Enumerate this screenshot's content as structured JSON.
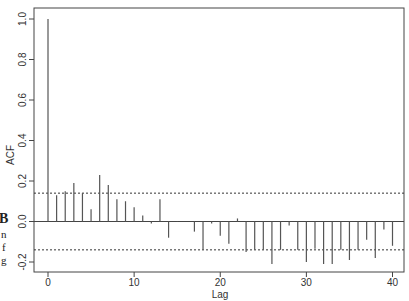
{
  "chart_data": {
    "type": "bar",
    "subtype": "acf-correlogram",
    "title": "",
    "xlabel": "Lag",
    "ylabel": "ACF",
    "x": [
      0,
      1,
      2,
      3,
      4,
      5,
      6,
      7,
      8,
      9,
      10,
      11,
      12,
      13,
      14,
      15,
      16,
      17,
      18,
      19,
      20,
      21,
      22,
      23,
      24,
      25,
      26,
      27,
      28,
      29,
      30,
      31,
      32,
      33,
      34,
      35,
      36,
      37,
      38,
      39,
      40
    ],
    "values": [
      1.0,
      0.13,
      0.15,
      0.19,
      0.14,
      0.06,
      0.23,
      0.18,
      0.11,
      0.1,
      0.07,
      0.03,
      -0.01,
      0.11,
      -0.08,
      0.003,
      0.0,
      -0.05,
      -0.14,
      -0.01,
      -0.07,
      -0.11,
      0.015,
      -0.15,
      -0.14,
      -0.14,
      -0.21,
      -0.14,
      -0.02,
      -0.14,
      -0.2,
      -0.135,
      -0.21,
      -0.21,
      -0.14,
      -0.19,
      -0.14,
      -0.09,
      -0.18,
      -0.04,
      -0.12
    ],
    "confidence_bounds": [
      0.14,
      -0.14
    ],
    "xlim": [
      -1.6,
      41.5
    ],
    "ylim": [
      -0.25,
      1.05
    ],
    "xticks": [
      0,
      10,
      20,
      30,
      40
    ],
    "xtick_labels": [
      "0",
      "10",
      "20",
      "30",
      "40"
    ],
    "yticks": [
      -0.2,
      0.0,
      0.2,
      0.4,
      0.6,
      0.8,
      1.0
    ],
    "ytick_labels": [
      "-0.2",
      "0.0",
      "0.2",
      "0.4",
      "0.6",
      "0.8",
      "1.0"
    ],
    "grid": false,
    "legend": null,
    "colors": {
      "bars": "#555555",
      "bounds": "#333333",
      "axis": "#444444"
    }
  },
  "margin_fragments": [
    "B",
    "n",
    "f",
    "g"
  ]
}
